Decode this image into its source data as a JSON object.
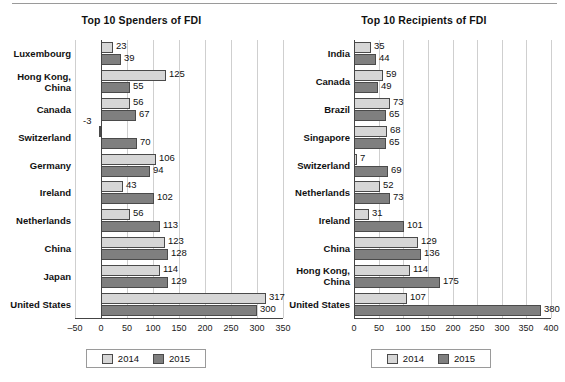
{
  "colors": {
    "series_2014": "#d6d6d6",
    "series_2015": "#7f7f7f",
    "bar_border": "#4a4a4a",
    "gridline": "#cfcfcf",
    "axis": "#444444",
    "background": "#ffffff",
    "text": "#111111"
  },
  "legend": {
    "label_2014": "2014",
    "label_2015": "2015"
  },
  "chart_data": [
    {
      "id": "spenders",
      "type": "bar",
      "orientation": "horizontal",
      "title": "Top 10 Spenders of FDI",
      "xlabel": "",
      "ylabel": "",
      "xlim": [
        -50,
        350
      ],
      "xticks": [
        -50,
        0,
        50,
        100,
        150,
        200,
        250,
        300,
        350
      ],
      "xtick_labels": [
        "–50",
        "0",
        "50",
        "100",
        "150",
        "200",
        "250",
        "300",
        "350"
      ],
      "grid": true,
      "legend_position": "bottom",
      "categories": [
        "Luxembourg",
        "Hong Kong,\nChina",
        "Canada",
        "Switzerland",
        "Germany",
        "Ireland",
        "Netherlands",
        "China",
        "Japan",
        "United States"
      ],
      "series": [
        {
          "name": "2014",
          "color": "#d6d6d6",
          "values": [
            23,
            125,
            56,
            -3,
            106,
            43,
            56,
            123,
            114,
            317
          ]
        },
        {
          "name": "2015",
          "color": "#7f7f7f",
          "values": [
            39,
            55,
            67,
            70,
            94,
            102,
            113,
            128,
            129,
            300
          ]
        }
      ]
    },
    {
      "id": "recipients",
      "type": "bar",
      "orientation": "horizontal",
      "title": "Top 10 Recipients of FDI",
      "xlabel": "",
      "ylabel": "",
      "xlim": [
        0,
        400
      ],
      "xticks": [
        0,
        50,
        100,
        150,
        200,
        250,
        300,
        350,
        400
      ],
      "xtick_labels": [
        "0",
        "50",
        "100",
        "150",
        "200",
        "250",
        "300",
        "350",
        "400"
      ],
      "grid": true,
      "legend_position": "bottom",
      "categories": [
        "India",
        "Canada",
        "Brazil",
        "Singapore",
        "Switzerland",
        "Netherlands",
        "Ireland",
        "China",
        "Hong Kong,\nChina",
        "United States"
      ],
      "series": [
        {
          "name": "2014",
          "color": "#d6d6d6",
          "values": [
            35,
            59,
            73,
            68,
            7,
            52,
            31,
            129,
            114,
            107
          ]
        },
        {
          "name": "2015",
          "color": "#7f7f7f",
          "values": [
            44,
            49,
            65,
            65,
            69,
            73,
            101,
            136,
            175,
            380
          ]
        }
      ]
    }
  ]
}
